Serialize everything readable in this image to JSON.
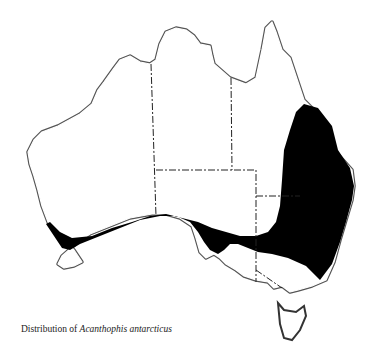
{
  "map": {
    "region": "Australia",
    "legend": {
      "shaded_area": "Distribution range",
      "shade_color": "#000000"
    },
    "boundaries": "State borders shown as dash-dot lines"
  },
  "caption": {
    "prefix": "Distribution of ",
    "species": "Acanthophis antarcticus"
  }
}
